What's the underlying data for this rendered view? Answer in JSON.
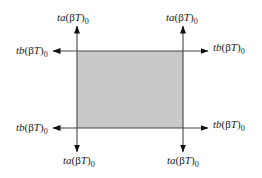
{
  "diagram": {
    "type": "rectangle-with-corner-arrows",
    "region": {
      "fill": "#c9c9c9",
      "stroke": "#444444"
    },
    "labels": {
      "top_left_vertical": {
        "prefix": "ta",
        "open": "(",
        "beta": "β",
        "var": "T",
        "close": ")",
        "sub": "0"
      },
      "top_left_horizontal": {
        "prefix": "tb",
        "open": "(",
        "beta": "β",
        "var": "T",
        "close": ")",
        "sub": "0"
      },
      "top_right_vertical": {
        "prefix": "ta",
        "open": "(",
        "beta": "β",
        "var": "T",
        "close": ")",
        "sub": "0"
      },
      "top_right_horizontal": {
        "prefix": "tb",
        "open": "(",
        "beta": "β",
        "var": "T",
        "close": ")",
        "sub": "0"
      },
      "bottom_left_horizontal": {
        "prefix": "tb",
        "open": "(",
        "beta": "β",
        "var": "T",
        "close": ")",
        "sub": "0"
      },
      "bottom_left_vertical": {
        "prefix": "ta",
        "open": "(",
        "beta": "β",
        "var": "T",
        "close": ")",
        "sub": "0"
      },
      "bottom_right_horizontal": {
        "prefix": "tb",
        "open": "(",
        "beta": "β",
        "var": "T",
        "close": ")",
        "sub": "0"
      },
      "bottom_right_vertical": {
        "prefix": "ta",
        "open": "(",
        "beta": "β",
        "var": "T",
        "close": ")",
        "sub": "0"
      }
    }
  }
}
